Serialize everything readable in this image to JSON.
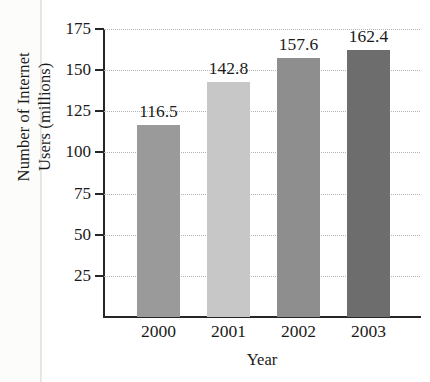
{
  "chart_data": {
    "type": "bar",
    "title": "",
    "xlabel": "Year",
    "ylabel_line1": "Number of Internet",
    "ylabel_line2": "Users (millions)",
    "ylabel": "Number of Internet Users (millions)",
    "categories": [
      "2000",
      "2001",
      "2002",
      "2003"
    ],
    "values": [
      116.5,
      142.8,
      157.6,
      162.4
    ],
    "value_labels": [
      "116.5",
      "142.8",
      "157.6",
      "162.4"
    ],
    "ylim": [
      0,
      175
    ],
    "ytick_values": [
      25,
      50,
      75,
      100,
      125,
      150,
      175
    ],
    "ytick_labels": [
      "25",
      "50",
      "75",
      "100",
      "125",
      "150",
      "175"
    ],
    "grid": true,
    "grid_style": "dotted",
    "legend": "none",
    "bar_colors": [
      "#9a9a9a",
      "#c7c7c7",
      "#8e8e8e",
      "#6d6d6d"
    ],
    "axis_color": "#262626",
    "grid_color": "#b3b3b3",
    "background": "#ffffff"
  }
}
